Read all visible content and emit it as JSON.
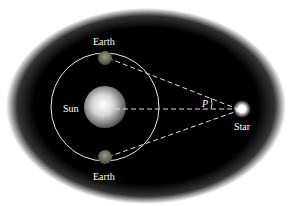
{
  "diagram": {
    "labels": {
      "earth_top": "Earth",
      "earth_bottom": "Earth",
      "sun": "Sun",
      "star": "Star",
      "angle": "P"
    },
    "colors": {
      "background": "#000000",
      "orbit": "#e8e8e8",
      "lines": "#e0e0e0"
    }
  }
}
